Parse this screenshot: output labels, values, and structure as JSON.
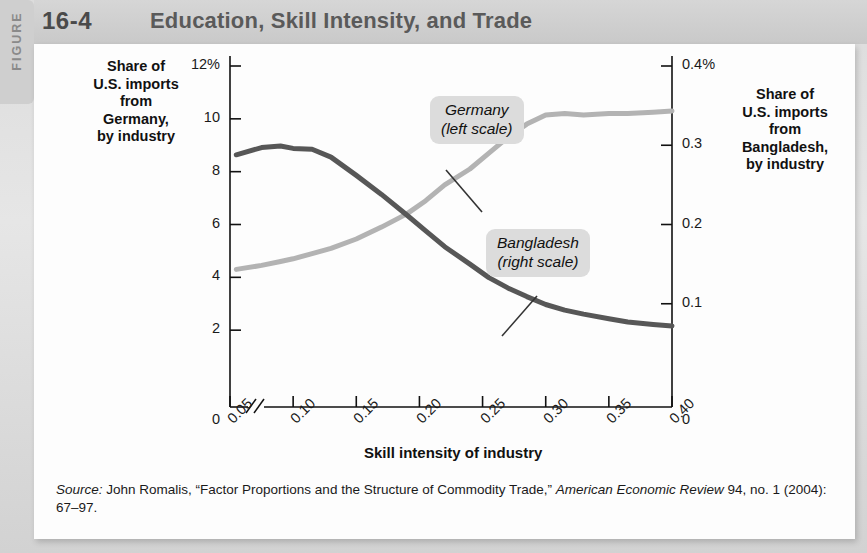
{
  "figure": {
    "tab_label": "FIGURE",
    "number": "16-4",
    "title": "Education, Skill Intensity, and Trade"
  },
  "axes": {
    "left_title": "Share of\nU.S. imports\nfrom\nGermany,\nby industry",
    "right_title": "Share of\nU.S. imports\nfrom\nBangladesh,\nby industry",
    "x_title": "Skill intensity of industry",
    "left_ticks": [
      "12%",
      "10",
      "8",
      "6",
      "4",
      "2",
      "0"
    ],
    "right_ticks": [
      "0.4%",
      "0.3",
      "0.2",
      "0.1",
      "0"
    ],
    "x_ticks": [
      "0.05",
      "0.10",
      "0.15",
      "0.20",
      "0.25",
      "0.30",
      "0.35",
      "0.40"
    ],
    "x_axis_break": true
  },
  "callouts": {
    "germany_line1": "Germany",
    "germany_line2": "(left scale)",
    "bangladesh_line1": "Bangladesh",
    "bangladesh_line2": "(right scale)"
  },
  "source": {
    "label": "Source:",
    "text_a": " John Romalis, “Factor Proportions and the Structure of Commodity Trade,” ",
    "text_b": "American Economic Review",
    "text_c": " 94, no. 1 (2004): 67–97."
  },
  "colors": {
    "germany_line": "#b3b3b3",
    "bangladesh_line": "#575757",
    "callout_bg": "#dcdcdc",
    "header_band": "#cfcfcf",
    "card_bg": "#fdfdfd",
    "page_bg": "#d9d9d9",
    "axis": "#111111"
  },
  "chart_data": {
    "type": "line",
    "title": "Education, Skill Intensity, and Trade",
    "xlabel": "Skill intensity of industry",
    "ylabel": "Share of U.S. imports from Germany, by industry",
    "y2label": "Share of U.S. imports from Bangladesh, by industry",
    "xlim": [
      0.05,
      0.4
    ],
    "ylim": [
      0,
      12
    ],
    "y2lim": [
      0,
      0.4
    ],
    "grid": false,
    "legend_position": "inline-callouts",
    "x": [
      0.055,
      0.075,
      0.09,
      0.1,
      0.115,
      0.13,
      0.15,
      0.17,
      0.19,
      0.205,
      0.22,
      0.24,
      0.255,
      0.27,
      0.285,
      0.3,
      0.315,
      0.33,
      0.35,
      0.365,
      0.385,
      0.4
    ],
    "series": [
      {
        "name": "Germany (left scale)",
        "axis": "left",
        "unit": "%",
        "color": "#b3b3b3",
        "values": [
          4.3,
          4.45,
          4.6,
          4.7,
          4.9,
          5.1,
          5.45,
          5.9,
          6.4,
          6.9,
          7.5,
          8.1,
          8.7,
          9.3,
          9.8,
          10.15,
          10.2,
          10.15,
          10.2,
          10.2,
          10.25,
          10.3
        ]
      },
      {
        "name": "Bangladesh (right scale)",
        "axis": "right",
        "unit": "%",
        "color": "#575757",
        "values": [
          0.288,
          0.297,
          0.299,
          0.296,
          0.295,
          0.285,
          0.262,
          0.238,
          0.212,
          0.192,
          0.172,
          0.15,
          0.133,
          0.12,
          0.109,
          0.099,
          0.092,
          0.087,
          0.081,
          0.077,
          0.074,
          0.072
        ]
      }
    ]
  }
}
